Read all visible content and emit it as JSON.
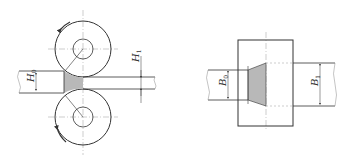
{
  "colors": {
    "line": "#333333",
    "fill": "#b8b8b8",
    "centerline": "#999999"
  },
  "left_figure": {
    "labels": {
      "h0_main": "H",
      "h0_sub": "0",
      "h1_main": "H",
      "h1_sub": "1"
    }
  },
  "right_figure": {
    "labels": {
      "b0_main": "B",
      "b0_sub": "0",
      "b1_main": "B",
      "b1_sub": "1"
    }
  }
}
